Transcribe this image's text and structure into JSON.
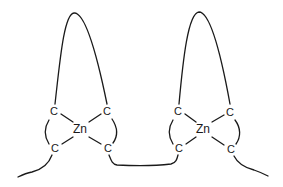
{
  "diagram": {
    "type": "chemical-structure",
    "colors": {
      "stroke": "#1a1a1a",
      "background": "#ffffff"
    },
    "complexes": [
      {
        "id": "left",
        "center": {
          "label": "Zn",
          "x": 80,
          "y": 132
        },
        "atoms": [
          {
            "label": "C",
            "x": 54,
            "y": 115
          },
          {
            "label": "C",
            "x": 107,
            "y": 115
          },
          {
            "label": "C",
            "x": 55,
            "y": 152
          },
          {
            "label": "C",
            "x": 108,
            "y": 152
          }
        ]
      },
      {
        "id": "right",
        "center": {
          "label": "Zn",
          "x": 203,
          "y": 132
        },
        "atoms": [
          {
            "label": "C",
            "x": 178,
            "y": 115
          },
          {
            "label": "C",
            "x": 230,
            "y": 116
          },
          {
            "label": "C",
            "x": 179,
            "y": 152
          },
          {
            "label": "C",
            "x": 231,
            "y": 153
          }
        ]
      }
    ]
  }
}
